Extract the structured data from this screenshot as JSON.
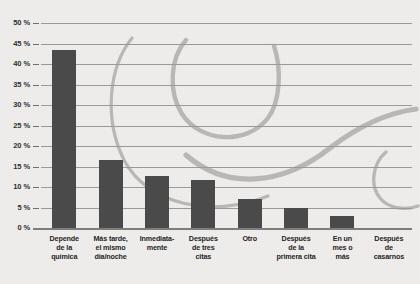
{
  "chart_data": {
    "type": "bar",
    "title": "",
    "xlabel": "",
    "ylabel": "",
    "categories": [
      "Depende\nde la\nquímica",
      "Más tarde,\nel mismo\ndía/noche",
      "Inmediata-\nmente",
      "Después\nde tres\ncitas",
      "Otro",
      "Después\nde la\nprimera cita",
      "En un\nmes o\nmás",
      "Después\nde\ncasarnos"
    ],
    "values": [
      43.5,
      16.5,
      12.8,
      11.8,
      7.0,
      5.0,
      3.0,
      0
    ],
    "ylim": [
      0,
      50
    ],
    "ytick_values": [
      0,
      5,
      10,
      15,
      20,
      25,
      30,
      35,
      40,
      45,
      50
    ],
    "ytick_labels": [
      "0 %",
      "5 %",
      "10 %",
      "15 %",
      "20 %",
      "25 %",
      "30 %",
      "35 %",
      "40 %",
      "45 %",
      "50 %"
    ],
    "grid": true,
    "legend": "none",
    "bar_color": "#4a4a4a",
    "grid_color": "#9b9a98",
    "background_color": "#f1efed",
    "watermark_color": "#b9b7b4"
  },
  "decoration": {
    "watermark_name": "swirl-watermark",
    "top_cut_text": ""
  }
}
